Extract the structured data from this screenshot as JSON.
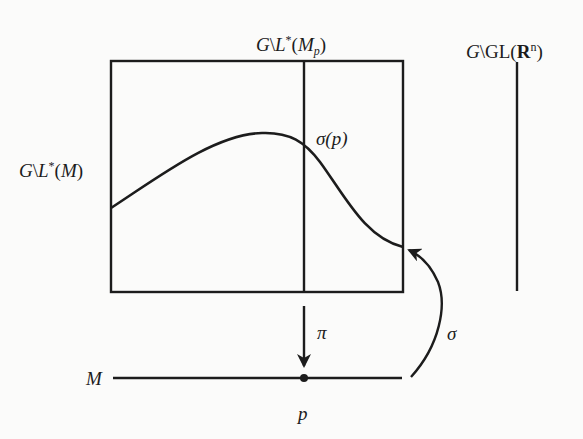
{
  "diagram": {
    "labels": {
      "fiber_Mp": {
        "G": "G",
        "bs": "\\",
        "L": "L",
        "star": "*",
        "open": "(",
        "M": "M",
        "sub": "p",
        "close": ")"
      },
      "frame_bundle": {
        "G": "G",
        "bs": "\\",
        "GL": "GL(",
        "R": "R",
        "sup": "n",
        "close": ")"
      },
      "bundle_M": {
        "G": "G",
        "bs": "\\",
        "L": "L",
        "star": "*",
        "open": "(",
        "M": "M",
        "close": ")"
      },
      "sigma_p": "σ(p)",
      "pi": "π",
      "sigma": "σ",
      "base_M": "M",
      "point_p": "p"
    },
    "colors": {
      "ink": "#1c1c1c",
      "paper": "#fbfbfa"
    }
  }
}
